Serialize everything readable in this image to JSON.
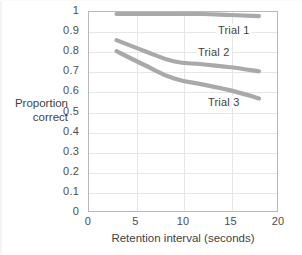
{
  "chart_data": {
    "type": "line",
    "title": "",
    "xlabel": "Retention interval (seconds)",
    "ylabel": "Proportion correct",
    "ylabel_line1": "Proportion",
    "ylabel_line2": "correct",
    "xlim": [
      0,
      20
    ],
    "ylim": [
      0,
      1
    ],
    "xticks": [
      0,
      5,
      10,
      15,
      20
    ],
    "xtick_labels": [
      "0",
      "5",
      "10",
      "15",
      "20"
    ],
    "yticks": [
      0,
      0.1,
      0.2,
      0.3,
      0.4,
      0.5,
      0.6,
      0.7,
      0.8,
      0.9,
      1
    ],
    "ytick_labels": [
      "0",
      "0.1",
      "0.2",
      "0.3",
      "0.4",
      "0.5",
      "0.6",
      "0.7",
      "0.8",
      "0.9",
      "1"
    ],
    "grid": true,
    "legend_position": "inline-annotations",
    "line_color": "#a9a9ab",
    "grid_color": "#e6e6e7",
    "frame_color": "#b9b9bb",
    "background": "#ffffff",
    "series": [
      {
        "name": "Trial 1",
        "label": "Trial 1",
        "color": "#a9a9ab",
        "x": [
          3,
          6,
          9,
          12,
          15,
          18
        ],
        "values": [
          0.985,
          0.985,
          0.985,
          0.985,
          0.98,
          0.975
        ]
      },
      {
        "name": "Trial 2",
        "label": "Trial 2",
        "color": "#a9a9ab",
        "x": [
          3,
          6,
          9,
          12,
          15,
          18
        ],
        "values": [
          0.855,
          0.8,
          0.75,
          0.735,
          0.72,
          0.7
        ]
      },
      {
        "name": "Trial 3",
        "label": "Trial 3",
        "color": "#a9a9ab",
        "x": [
          3,
          6,
          9,
          12,
          15,
          18
        ],
        "values": [
          0.8,
          0.73,
          0.665,
          0.635,
          0.605,
          0.565
        ]
      }
    ]
  }
}
